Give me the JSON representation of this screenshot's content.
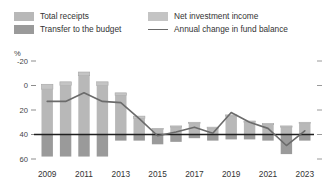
{
  "legend": {
    "items": [
      {
        "label": "Total receipts",
        "kind": "swatch",
        "color": "#b8b8b8"
      },
      {
        "label": "Transfer to the budget",
        "kind": "swatch",
        "color": "#9a9a9a"
      },
      {
        "label": "Net investment income",
        "kind": "swatch",
        "color": "#c4c4c4"
      },
      {
        "label": "Annual change in fund balance",
        "kind": "line",
        "color": "#6b6b6b"
      }
    ]
  },
  "axis": {
    "unit_label": "%",
    "y_ticks": [
      "60",
      "40",
      "20",
      "0",
      "-20"
    ],
    "x_ticks": [
      "2009",
      "2011",
      "2013",
      "2015",
      "2017",
      "2019",
      "2021",
      "2023"
    ]
  },
  "chart_data": {
    "type": "bar",
    "title": "",
    "xlabel": "",
    "ylabel": "%",
    "ylim": [
      -20,
      60
    ],
    "y_ticks": [
      -20,
      0,
      20,
      40,
      60
    ],
    "grid": false,
    "legend_position": "top",
    "stacked": true,
    "categories": [
      "2009",
      "2010",
      "2011",
      "2012",
      "2013",
      "2014",
      "2015",
      "2016",
      "2017",
      "2018",
      "2019",
      "2020",
      "2021",
      "2022",
      "2023"
    ],
    "series": [
      {
        "name": "Total receipts",
        "type": "bar",
        "color": "#b8b8b8",
        "values": [
          37,
          40,
          48,
          40,
          32,
          13,
          4,
          6,
          9,
          5,
          15,
          10,
          8,
          6,
          9
        ]
      },
      {
        "name": "Net investment income",
        "type": "bar",
        "color": "#c4c4c4",
        "values": [
          4,
          3,
          3,
          3,
          2,
          2,
          1,
          1,
          1,
          1,
          1,
          1,
          1,
          1,
          1
        ]
      },
      {
        "name": "Transfer to the budget",
        "type": "bar",
        "color": "#9a9a9a",
        "values": [
          -18,
          -18,
          -18,
          -18,
          -5,
          -5,
          -8,
          -6,
          -3,
          -5,
          -4,
          -4,
          -5,
          -16,
          -5
        ]
      },
      {
        "name": "Annual change in fund balance",
        "type": "line",
        "color": "#6b6b6b",
        "values": [
          27,
          27,
          34,
          27,
          26,
          13,
          -1,
          2,
          6,
          1,
          18,
          10,
          5,
          -9,
          3
        ]
      }
    ]
  }
}
